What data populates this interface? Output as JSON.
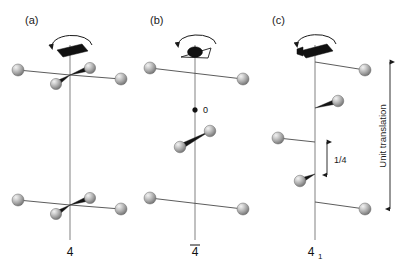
{
  "figure": {
    "type": "crystallographic-symmetry-diagram",
    "background_color": "#ffffff",
    "sphere_color": "#a8a8a8",
    "sphere_highlight_color": "#e6e6e6",
    "axis_color": "#8c8c8c",
    "ink_color": "#111111"
  },
  "panels": [
    {
      "id": "a",
      "label": "(a)",
      "axis_symbol_name": "four-fold-rotation-axis-filled-square",
      "rotation_arrow": "counterclockwise",
      "axis_label": "4",
      "axis_label_overbar": false,
      "axis_label_subscript": "",
      "description": "Four-fold rotation axis with two sets of four equivalent atoms at the same heights",
      "label_x": 25,
      "label_y": 24,
      "axis_x": 70,
      "axis_top": 45,
      "axis_bottom": 240,
      "axis_label_x": 70,
      "axis_label_y": 256,
      "atom_groups": [
        {
          "node_y": 75,
          "atoms": [
            {
              "cx": 18,
              "cy": 70,
              "r": 6.0,
              "bond": "thin"
            },
            {
              "cx": 121,
              "cy": 79,
              "r": 6.0,
              "bond": "thin"
            },
            {
              "cx": 90,
              "cy": 68,
              "r": 5.6,
              "bond": "wedge"
            },
            {
              "cx": 56,
              "cy": 84,
              "r": 5.6,
              "bond": "wedge"
            }
          ]
        },
        {
          "node_y": 205,
          "atoms": [
            {
              "cx": 18,
              "cy": 200,
              "r": 6.0,
              "bond": "thin"
            },
            {
              "cx": 121,
              "cy": 209,
              "r": 6.0,
              "bond": "thin"
            },
            {
              "cx": 90,
              "cy": 198,
              "r": 5.6,
              "bond": "wedge"
            },
            {
              "cx": 56,
              "cy": 214,
              "r": 5.6,
              "bond": "wedge"
            }
          ]
        }
      ]
    },
    {
      "id": "b",
      "label": "(b)",
      "axis_symbol_name": "four-bar-rotoinversion-axis-oval-in-triangle",
      "rotation_arrow": "counterclockwise",
      "axis_label": "4",
      "axis_label_overbar": true,
      "axis_label_subscript": "",
      "inversion_point_label": "0",
      "description": "Four-bar rotoinversion axis; inversion centre marked 0, pairs of atoms above and below",
      "label_x": 150,
      "label_y": 24,
      "axis_x": 195,
      "axis_top": 45,
      "axis_bottom": 240,
      "axis_label_x": 195,
      "axis_label_y": 256,
      "inversion_point": {
        "cx": 195,
        "cy": 110,
        "r": 2.4,
        "label_x": 203,
        "label_y": 113
      },
      "atom_groups": [
        {
          "node_y": 70,
          "atoms": [
            {
              "cx": 150,
              "cy": 68,
              "r": 6.0,
              "bond": "thin"
            },
            {
              "cx": 243,
              "cy": 79,
              "r": 6.0,
              "bond": "thin"
            }
          ]
        },
        {
          "node_y": 0,
          "atoms": [
            {
              "cx": 180,
              "cy": 147,
              "r": 5.8,
              "bond": "wedge-pair"
            },
            {
              "cx": 210,
              "cy": 131,
              "r": 5.8,
              "bond": "wedge-pair"
            }
          ]
        },
        {
          "node_y": 203,
          "atoms": [
            {
              "cx": 150,
              "cy": 198,
              "r": 6.0,
              "bond": "thin"
            },
            {
              "cx": 243,
              "cy": 209,
              "r": 6.0,
              "bond": "thin"
            }
          ]
        }
      ]
    },
    {
      "id": "c",
      "label": "(c)",
      "axis_symbol_name": "four-one-screw-axis-filled-square-with-tails",
      "rotation_arrow": "counterclockwise",
      "axis_label": "4",
      "axis_label_overbar": false,
      "axis_label_subscript": "1",
      "description": "Four-one screw axis: each rotation step is accompanied by a translation of one quarter of the unit translation",
      "label_x": 272,
      "label_y": 24,
      "axis_x": 315,
      "axis_top": 45,
      "axis_bottom": 240,
      "axis_label_x": 315,
      "axis_label_y": 256,
      "atoms": [
        {
          "cx": 365,
          "cy": 70,
          "r": 6.0,
          "node_y": 62,
          "bond": "thin"
        },
        {
          "cx": 338,
          "cy": 101,
          "r": 5.8,
          "node_y": 108,
          "bond": "wedge"
        },
        {
          "cx": 278,
          "cy": 138,
          "r": 6.0,
          "node_y": 142,
          "bond": "thin"
        },
        {
          "cx": 300,
          "cy": 181,
          "r": 5.8,
          "node_y": 174,
          "bond": "wedge"
        },
        {
          "cx": 365,
          "cy": 209,
          "r": 6.0,
          "node_y": 202,
          "bond": "thin"
        }
      ],
      "quarter_dimension": {
        "label": "1/4",
        "x": 327,
        "top_y": 142,
        "bottom_y": 175,
        "label_x": 334,
        "label_y": 163
      },
      "unit_dimension": {
        "label": "Unit translation",
        "x": 390,
        "top_y": 62,
        "bottom_y": 209,
        "label_x": 386,
        "label_y": 136,
        "orientation": "vertical-rotated"
      }
    }
  ]
}
